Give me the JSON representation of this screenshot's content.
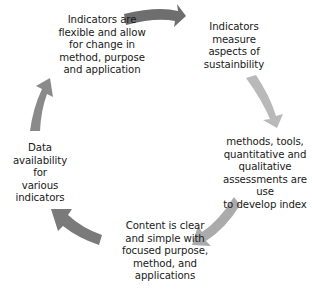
{
  "diagram": {
    "type": "cycle",
    "direction": "clockwise",
    "nodes": [
      {
        "id": "n1",
        "text": "Indicators are\nflexible and allow\nfor change in\nmethod, purpose\nand application"
      },
      {
        "id": "n2",
        "text": "Indicators\nmeasure\naspects of\nsustainbility"
      },
      {
        "id": "n3",
        "text": "methods, tools,\nquantitative and\nqualitative\nassessments are use\nto develop index"
      },
      {
        "id": "n5",
        "text": "Content is clear\nand simple with\nfocused purpose,\nmethod, and\napplications"
      },
      {
        "id": "n4",
        "text": "Data\navailability for\nvarious\nindicators"
      }
    ],
    "arrows": [
      {
        "from": "n1",
        "to": "n2",
        "color": "#6e6e6e"
      },
      {
        "from": "n2",
        "to": "n3",
        "color": "#b9b9b9"
      },
      {
        "from": "n3",
        "to": "n5",
        "color": "#ababab"
      },
      {
        "from": "n5",
        "to": "n4",
        "color": "#7a7a7a"
      },
      {
        "from": "n4",
        "to": "n1",
        "color": "#8a8a8a"
      }
    ]
  }
}
